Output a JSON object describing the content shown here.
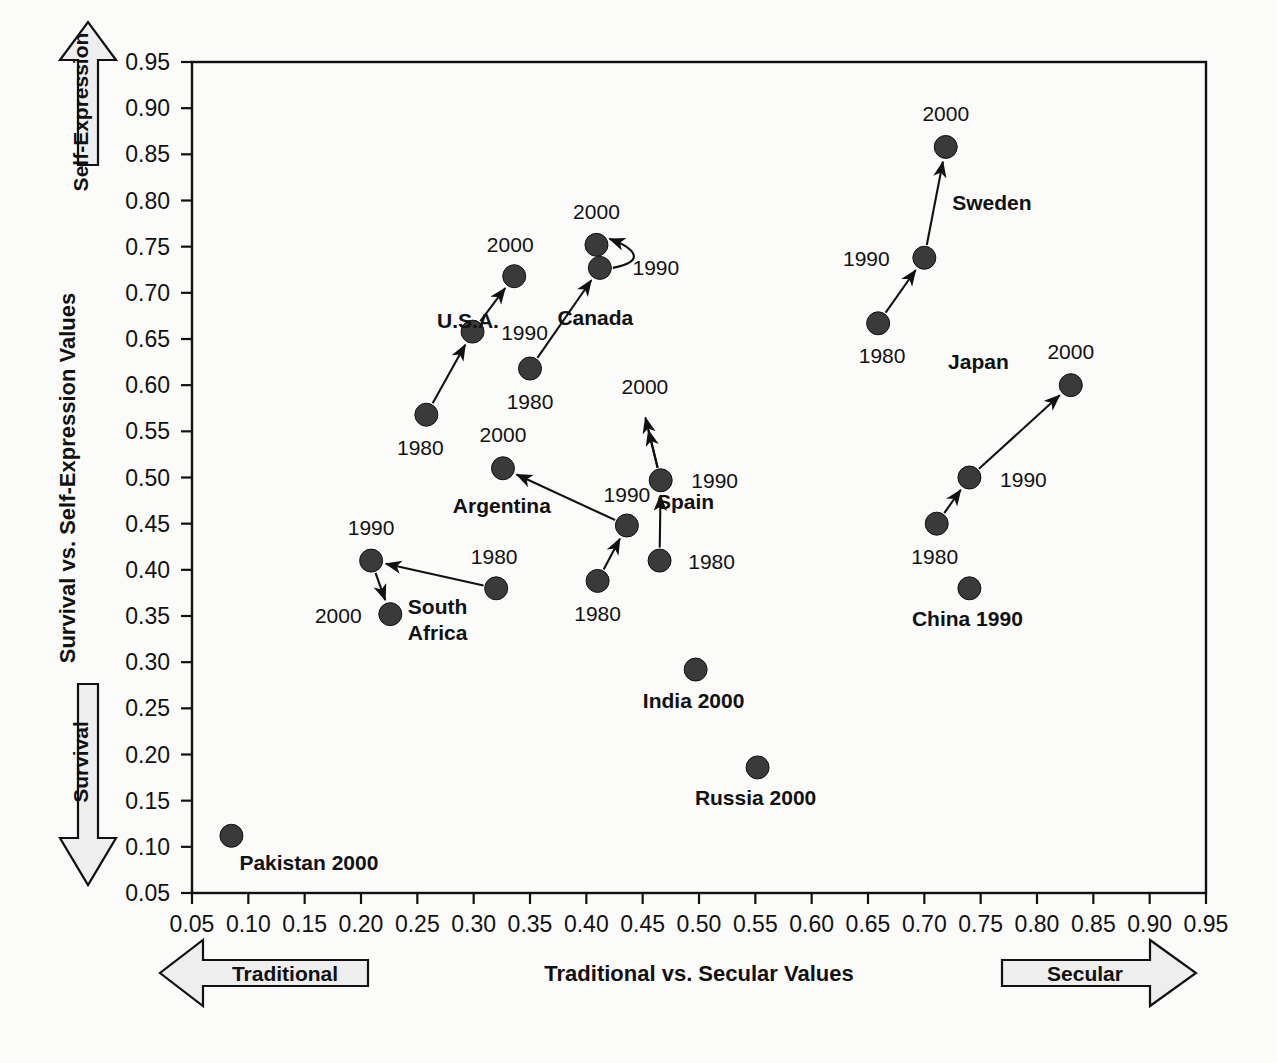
{
  "chart_data": {
    "type": "scatter",
    "title": "",
    "xlabel": "Traditional vs. Secular Values",
    "ylabel": "Survival vs. Self-Expression Values",
    "xlim": [
      0.05,
      0.95
    ],
    "ylim": [
      0.05,
      0.95
    ],
    "grid": false,
    "legend": "none",
    "xticks": [
      "0.05",
      "0.10",
      "0.15",
      "0.20",
      "0.25",
      "0.30",
      "0.35",
      "0.40",
      "0.45",
      "0.50",
      "0.55",
      "0.60",
      "0.65",
      "0.70",
      "0.75",
      "0.80",
      "0.85",
      "0.90",
      "0.95"
    ],
    "yticks": [
      "0.95",
      "0.90",
      "0.85",
      "0.80",
      "0.75",
      "0.70",
      "0.65",
      "0.60",
      "0.55",
      "0.50",
      "0.45",
      "0.40",
      "0.35",
      "0.30",
      "0.25",
      "0.20",
      "0.15",
      "0.10",
      "0.05"
    ],
    "axis_arrows": {
      "y_top": "Self-Expression",
      "y_bottom": "Survival",
      "x_left": "Traditional",
      "x_right": "Secular"
    },
    "series": [
      {
        "name": "U.S.A.",
        "label": "U.S.A.",
        "label_x": 0.295,
        "label_y": 0.662,
        "points": [
          {
            "year": "1980",
            "x": 0.258,
            "y": 0.568,
            "label_dx": -6,
            "label_dy": 40,
            "anchor": "middle"
          },
          {
            "year": "1990",
            "x": 0.299,
            "y": 0.658,
            "label_dx": 52,
            "label_dy": 8,
            "anchor": "middle"
          },
          {
            "year": "2000",
            "x": 0.336,
            "y": 0.718,
            "label_dx": -4,
            "label_dy": -24,
            "anchor": "middle"
          }
        ]
      },
      {
        "name": "Canada",
        "label": "Canada",
        "label_x": 0.408,
        "label_y": 0.665,
        "points": [
          {
            "year": "1980",
            "x": 0.35,
            "y": 0.618,
            "label_dx": 0,
            "label_dy": 40,
            "anchor": "middle"
          },
          {
            "year": "1990",
            "x": 0.412,
            "y": 0.727,
            "label_dx": 56,
            "label_dy": 7,
            "anchor": "middle"
          },
          {
            "year": "2000",
            "x": 0.409,
            "y": 0.752,
            "label_dx": 0,
            "label_dy": -26,
            "anchor": "middle"
          }
        ]
      },
      {
        "name": "Sweden",
        "label": "Sweden",
        "label_x": 0.76,
        "label_y": 0.79,
        "points": [
          {
            "year": "1980",
            "x": 0.659,
            "y": 0.667,
            "label_dx": 4,
            "label_dy": 40,
            "anchor": "middle"
          },
          {
            "year": "1990",
            "x": 0.7,
            "y": 0.738,
            "label_dx": -58,
            "label_dy": 8,
            "anchor": "middle"
          },
          {
            "year": "2000",
            "x": 0.719,
            "y": 0.858,
            "label_dx": 0,
            "label_dy": -26,
            "anchor": "middle"
          }
        ]
      },
      {
        "name": "Japan",
        "label": "Japan",
        "label_x": 0.748,
        "label_y": 0.617,
        "points": [
          {
            "year": "1980",
            "x": 0.711,
            "y": 0.45,
            "label_dx": -2,
            "label_dy": 40,
            "anchor": "middle"
          },
          {
            "year": "1990",
            "x": 0.74,
            "y": 0.5,
            "label_dx": 54,
            "label_dy": 9,
            "anchor": "middle"
          },
          {
            "year": "2000",
            "x": 0.83,
            "y": 0.6,
            "label_dx": 0,
            "label_dy": -26,
            "anchor": "middle"
          }
        ]
      },
      {
        "name": "Argentina",
        "label": "Argentina",
        "label_x": 0.325,
        "label_y": 0.462,
        "points": [
          {
            "year": "1980",
            "x": 0.41,
            "y": 0.388,
            "label_dx": 0,
            "label_dy": 40,
            "anchor": "middle"
          },
          {
            "year": "1990",
            "x": 0.436,
            "y": 0.448,
            "label_dx": 0,
            "label_dy": -24,
            "anchor": "middle"
          },
          {
            "year": "2000",
            "x": 0.326,
            "y": 0.51,
            "label_dx": 0,
            "label_dy": -26,
            "anchor": "middle"
          }
        ]
      },
      {
        "name": "Spain",
        "label": "Spain",
        "label_x": 0.488,
        "label_y": 0.466,
        "points": [
          {
            "year": "1980",
            "x": 0.465,
            "y": 0.41,
            "label_dx": 52,
            "label_dy": 8,
            "anchor": "middle"
          },
          {
            "year": "1990",
            "x": 0.466,
            "y": 0.497,
            "label_dx": 54,
            "label_dy": 8,
            "anchor": "middle"
          },
          {
            "year": "2000",
            "x": 0.452,
            "y": 0.567,
            "label_dx": 0,
            "label_dy": -22,
            "anchor": "middle",
            "hidden": true
          }
        ]
      },
      {
        "name": "South Africa",
        "label": "South\nAfrica",
        "label_x": 0.268,
        "label_y": 0.352,
        "points": [
          {
            "year": "1980",
            "x": 0.32,
            "y": 0.38,
            "label_dx": -2,
            "label_dy": -24,
            "anchor": "middle"
          },
          {
            "year": "1990",
            "x": 0.209,
            "y": 0.41,
            "label_dx": 0,
            "label_dy": -26,
            "anchor": "middle"
          },
          {
            "year": "2000",
            "x": 0.226,
            "y": 0.352,
            "label_dx": -52,
            "label_dy": 9,
            "anchor": "middle"
          }
        ]
      }
    ],
    "single_points": [
      {
        "name": "Pakistan 2000",
        "x": 0.085,
        "y": 0.112,
        "label_dx": 8,
        "label_dy": 34,
        "anchor": "start"
      },
      {
        "name": "India 2000",
        "x": 0.497,
        "y": 0.292,
        "label_dx": -2,
        "label_dy": 38,
        "anchor": "middle"
      },
      {
        "name": "Russia 2000",
        "x": 0.552,
        "y": 0.186,
        "label_dx": -2,
        "label_dy": 38,
        "anchor": "middle"
      },
      {
        "name": "China 1990",
        "x": 0.74,
        "y": 0.38,
        "label_dx": -2,
        "label_dy": 38,
        "anchor": "middle"
      }
    ]
  }
}
